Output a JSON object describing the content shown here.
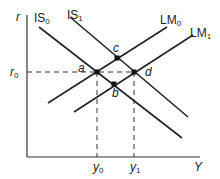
{
  "diagram": {
    "type": "IS-LM",
    "axes": {
      "y_label": "r",
      "x_label": "Y"
    },
    "curves": [
      {
        "id": "IS0",
        "label": "IS",
        "sub": "0",
        "color": "#222222"
      },
      {
        "id": "IS1",
        "label": "IS",
        "sub": "1",
        "color": "#222222"
      },
      {
        "id": "LM0",
        "label": "LM",
        "sub": "0",
        "color": "#222222"
      },
      {
        "id": "LM1",
        "label": "LM",
        "sub": "1",
        "color": "#222222"
      }
    ],
    "points": [
      {
        "id": "a",
        "label": "a"
      },
      {
        "id": "b",
        "label": "b"
      },
      {
        "id": "c",
        "label": "c"
      },
      {
        "id": "d",
        "label": "d"
      }
    ],
    "ticks": {
      "r0": {
        "label": "r",
        "sub": "0"
      },
      "y0": {
        "label": "y",
        "sub": "0"
      },
      "y1": {
        "label": "y",
        "sub": "1"
      }
    }
  }
}
